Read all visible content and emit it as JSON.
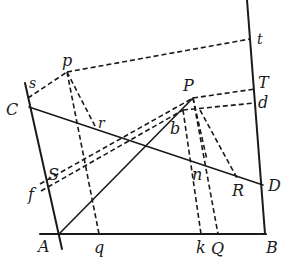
{
  "diagram": {
    "title": "",
    "points": {
      "A": {
        "label": "A",
        "x": 59,
        "y": 234
      },
      "B": {
        "label": "B",
        "x": 265,
        "y": 234
      },
      "C": {
        "label": "C",
        "x": 29,
        "y": 107
      },
      "D": {
        "label": "D",
        "x": 263,
        "y": 185
      },
      "p": {
        "label": "p",
        "x": 67,
        "y": 72
      },
      "P": {
        "label": "P",
        "x": 193,
        "y": 98
      },
      "s": {
        "label": "s",
        "x": 28,
        "y": 98
      },
      "t": {
        "label": "t",
        "x": 250,
        "y": 39
      },
      "r": {
        "label": "r",
        "x": 96,
        "y": 128
      },
      "T": {
        "label": "T",
        "x": 255,
        "y": 89
      },
      "d": {
        "label": "d",
        "x": 255,
        "y": 103
      },
      "b": {
        "label": "b",
        "x": 183,
        "y": 110
      },
      "S": {
        "label": "S",
        "x": 47,
        "y": 186
      },
      "f": {
        "label": "f",
        "x": 45,
        "y": 192
      },
      "n": {
        "label": "n",
        "x": 205,
        "y": 163
      },
      "R": {
        "label": "R",
        "x": 237,
        "y": 178
      },
      "q": {
        "label": "q",
        "x": 99,
        "y": 234
      },
      "k": {
        "label": "k",
        "x": 201,
        "y": 234
      },
      "Q": {
        "label": "Q",
        "x": 218,
        "y": 234
      }
    },
    "labels": {
      "A": "A",
      "B": "B",
      "C": "C",
      "D": "D",
      "p": "p",
      "P": "P",
      "s": "s",
      "t": "t",
      "r": "r",
      "T": "T",
      "d": "d",
      "b": "b",
      "S": "S",
      "f": "f",
      "n": "n",
      "R": "R",
      "q": "q",
      "k": "k",
      "Q": "Q"
    },
    "solid_segments": [
      [
        "A-ext-left",
        "B"
      ],
      [
        "left-line-top",
        "left-line-bottom"
      ],
      [
        "right-line-top",
        "B"
      ],
      [
        "C",
        "D"
      ],
      [
        "A",
        "P"
      ]
    ],
    "dashed_segments": [
      [
        "s",
        "p"
      ],
      [
        "p",
        "t"
      ],
      [
        "p",
        "r"
      ],
      [
        "p",
        "q"
      ],
      [
        "S",
        "P"
      ],
      [
        "f",
        "b"
      ],
      [
        "P",
        "T"
      ],
      [
        "b",
        "d"
      ],
      [
        "P",
        "Q"
      ],
      [
        "b",
        "k"
      ],
      [
        "P",
        "n"
      ],
      [
        "b",
        "R"
      ]
    ]
  }
}
